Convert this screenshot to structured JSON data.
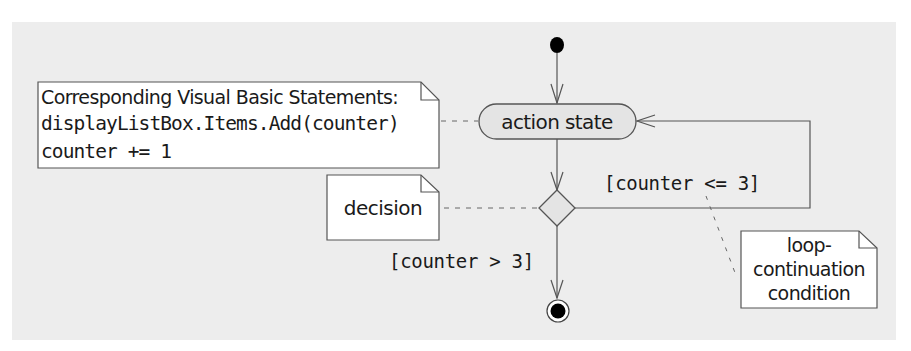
{
  "diagram": {
    "type": "UML activity diagram",
    "colors": {
      "background": "#ededed",
      "line": "#555555",
      "node_fill": "#e4e4e4",
      "note_fill": "#ffffff",
      "solid": "#000000"
    },
    "nodes": {
      "initial_state": {
        "kind": "initial",
        "label": ""
      },
      "action_state": {
        "kind": "action",
        "label": "action state"
      },
      "decision": {
        "kind": "decision",
        "label": ""
      },
      "final_state": {
        "kind": "final",
        "label": ""
      }
    },
    "notes": {
      "code_note": {
        "heading": "Corresponding Visual Basic Statements:",
        "lines": [
          "displayListBox.Items.Add(counter)",
          "counter += 1"
        ]
      },
      "decision_note": {
        "text": "decision"
      },
      "loop_note": {
        "lines": [
          "loop-",
          "continuation",
          "condition"
        ]
      }
    },
    "guards": {
      "loop": "[counter <= 3]",
      "exit": "[counter > 3]"
    },
    "transitions": [
      {
        "from": "initial_state",
        "to": "action_state",
        "guard": ""
      },
      {
        "from": "action_state",
        "to": "decision",
        "guard": ""
      },
      {
        "from": "decision",
        "to": "action_state",
        "guard": "[counter <= 3]"
      },
      {
        "from": "decision",
        "to": "final_state",
        "guard": "[counter > 3]"
      }
    ]
  }
}
